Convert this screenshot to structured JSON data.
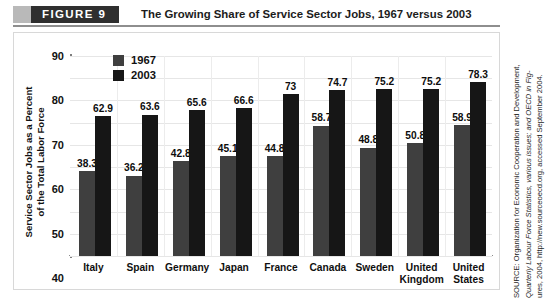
{
  "header": {
    "figure_tab_label": "FIGURE  9",
    "title": "The Growing Share of Service Sector Jobs, 1967 versus 2003"
  },
  "source": {
    "line1": "SOURCE: Organization for Economic Cooperation and Development,",
    "line2": "Quarterly Labour Force Statistics, various issues; and OECD in Fig-",
    "line3": "ures, 2004, http://new.sourceoecd.org, accessed September 2004."
  },
  "colors": {
    "series_1967": "#3f3f3f",
    "series_2003": "#161616",
    "tab_dark": "#2f2f2f",
    "tab_gray": "#b9b9b9",
    "grid": "#e6e6e6",
    "axis": "#7d7d7d"
  },
  "chart_data": {
    "type": "bar",
    "title": "The Growing Share of Service Sector Jobs, 1967 versus 2003",
    "xlabel": "",
    "ylabel": "Service Sector Jobs as a Percent of the Total Labor Force",
    "ylabel_line1": "Service Sector Jobs as a Percent",
    "ylabel_line2": "of the Total Labor Force",
    "ylim": [
      0,
      90
    ],
    "yticks": [
      90,
      80,
      70,
      60,
      50,
      40,
      30,
      20,
      10,
      0
    ],
    "ytick_labels": [
      "90",
      "80",
      "70",
      "60",
      "50",
      "40",
      "30",
      "20",
      "10",
      "0"
    ],
    "grid": true,
    "legend_position": "upper-left-inside",
    "categories": [
      "Italy",
      "Spain",
      "Germany",
      "Japan",
      "France",
      "Canada",
      "Sweden",
      "United\nKingdom",
      "United\nStates"
    ],
    "series": [
      {
        "name": "1967",
        "color": "#3f3f3f",
        "values": [
          38.3,
          36.2,
          42.8,
          45.1,
          44.8,
          58.7,
          48.8,
          50.8,
          58.9
        ],
        "labels": [
          "38.3",
          "36.2",
          "42.8",
          "45.1",
          "44.8",
          "58.7",
          "48.8",
          "50.8",
          "58.9"
        ]
      },
      {
        "name": "2003",
        "color": "#161616",
        "values": [
          62.9,
          63.6,
          65.6,
          66.6,
          73,
          74.7,
          75.2,
          75.2,
          78.3
        ],
        "labels": [
          "62.9",
          "63.6",
          "65.6",
          "66.6",
          "73",
          "74.7",
          "75.2",
          "75.2",
          "78.3"
        ]
      }
    ]
  }
}
